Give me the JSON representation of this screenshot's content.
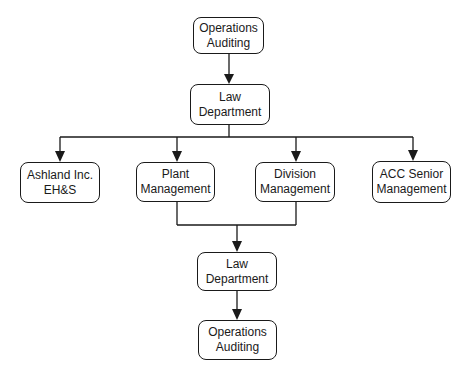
{
  "nodes": {
    "ops_top": {
      "line1": "Operations",
      "line2": "Auditing"
    },
    "law_top": {
      "line1": "Law",
      "line2": "Department"
    },
    "ashland": {
      "line1": "Ashland Inc.",
      "line2": "EH&S"
    },
    "plant": {
      "line1": "Plant",
      "line2": "Management"
    },
    "division": {
      "line1": "Division",
      "line2": "Management"
    },
    "acc": {
      "line1": "ACC Senior",
      "line2": "Management"
    },
    "law_bottom": {
      "line1": "Law",
      "line2": "Department"
    },
    "ops_bottom": {
      "line1": "Operations",
      "line2": "Auditing"
    }
  },
  "edges": [
    {
      "from": "ops_top",
      "to": "law_top"
    },
    {
      "from": "law_top",
      "to": "ashland"
    },
    {
      "from": "law_top",
      "to": "plant"
    },
    {
      "from": "law_top",
      "to": "division"
    },
    {
      "from": "law_top",
      "to": "acc"
    },
    {
      "from": "plant",
      "to": "law_bottom"
    },
    {
      "from": "division",
      "to": "law_bottom"
    },
    {
      "from": "law_bottom",
      "to": "ops_bottom"
    }
  ]
}
